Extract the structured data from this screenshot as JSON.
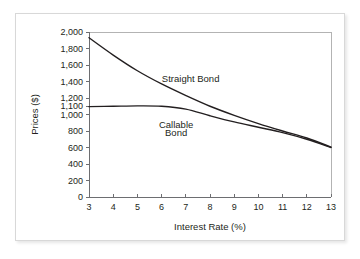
{
  "chart_data": {
    "type": "line",
    "title": "",
    "xlabel": "Interest Rate (%)",
    "ylabel": "Prices ($)",
    "xlim": [
      3,
      13
    ],
    "ylim": [
      0,
      2000
    ],
    "grid": false,
    "legend_position": "inline-annotation",
    "x_ticks": [
      "3",
      "4",
      "5",
      "6",
      "7",
      "8",
      "9",
      "10",
      "11",
      "12",
      "13"
    ],
    "x_tick_values": [
      3,
      4,
      5,
      6,
      7,
      8,
      9,
      10,
      11,
      12,
      13
    ],
    "y_ticks": [
      "0",
      "200",
      "400",
      "600",
      "800",
      "1,000",
      "1,100",
      "1,200",
      "1,400",
      "1,600",
      "1,800",
      "2,000"
    ],
    "y_tick_values": [
      0,
      200,
      400,
      600,
      800,
      1000,
      1100,
      1200,
      1400,
      1600,
      1800,
      2000
    ],
    "x": [
      3,
      4,
      5,
      6,
      7,
      8,
      9,
      10,
      11,
      12,
      13
    ],
    "series": [
      {
        "name": "Straight Bond",
        "values": [
          1930,
          1720,
          1530,
          1370,
          1230,
          1100,
          990,
          890,
          800,
          715,
          605
        ]
      },
      {
        "name": "Callable Bond",
        "values": [
          1095,
          1100,
          1105,
          1100,
          1065,
          985,
          910,
          845,
          780,
          700,
          600
        ]
      }
    ],
    "annotations": [
      {
        "text": "Straight Bond",
        "x": 7.2,
        "y": 1400
      },
      {
        "text": "Callable",
        "x": 6.6,
        "y": 840
      },
      {
        "text": "Bond",
        "x": 6.6,
        "y": 740
      }
    ]
  },
  "axes": {
    "x_title": "Interest Rate (%)",
    "y_title": "Prices ($)"
  },
  "labels": {
    "straight_bond": "Straight Bond",
    "callable_bond_line1": "Callable",
    "callable_bond_line2": "Bond"
  },
  "colors": {
    "curve": "#231f20",
    "axis": "#6d6e71",
    "frame": "#b3b3b3",
    "card_border": "#d8d8d8",
    "background": "#ffffff"
  }
}
